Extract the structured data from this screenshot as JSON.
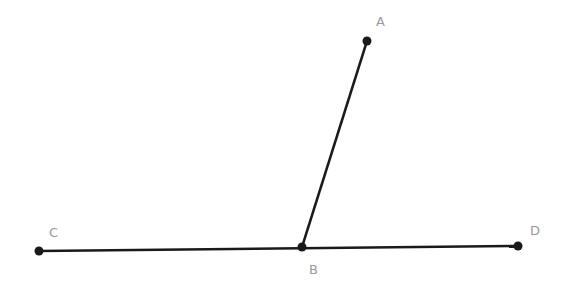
{
  "diagram": {
    "points": {
      "A": {
        "label": "A",
        "x": 367,
        "y": 41,
        "lx": 376,
        "ly": 26
      },
      "B": {
        "label": "B",
        "x": 302,
        "y": 247,
        "lx": 309,
        "ly": 274
      },
      "C": {
        "label": "C",
        "x": 39,
        "y": 251,
        "lx": 49,
        "ly": 237
      },
      "D": {
        "label": "D",
        "x": 518,
        "y": 246,
        "lx": 530,
        "ly": 235
      }
    },
    "segments": [
      [
        "C",
        "D"
      ],
      [
        "B",
        "A"
      ]
    ],
    "colors": {
      "line": "#1a1a1a",
      "point": "#1a1a1a",
      "label": "#9a9a9a"
    }
  }
}
